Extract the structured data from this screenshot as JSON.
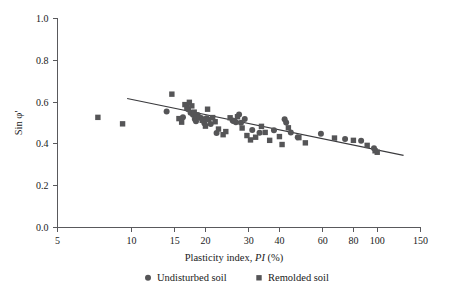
{
  "chart_data": {
    "type": "scatter",
    "title": "",
    "xlabel": "Plasticity index, PI (%)",
    "xlabel_parts": {
      "prefix": "Plasticity index, ",
      "italic": "PI",
      "suffix": " (%)"
    },
    "ylabel": "Sin φ'",
    "xscale": "log",
    "xlim": [
      5,
      150
    ],
    "ylim": [
      0.0,
      1.0
    ],
    "xticks": [
      5,
      10,
      15,
      20,
      30,
      40,
      60,
      80,
      100,
      150
    ],
    "xticklabels": [
      "5",
      "10",
      "15",
      "20",
      "30",
      "40",
      "60",
      "80",
      "100",
      "150"
    ],
    "yticks": [
      0.0,
      0.2,
      0.4,
      0.6,
      0.8,
      1.0
    ],
    "yticklabels": [
      "0.0",
      "0.2",
      "0.4",
      "0.6",
      "0.8",
      "1.0"
    ],
    "grid": false,
    "legend_position": "below",
    "marker_color": "#555557",
    "line_color": "#3a3a3d",
    "axis_color": "#59595c",
    "trend_line": {
      "label": "regression line",
      "x": [
        9.6,
        128.0
      ],
      "y": [
        0.617,
        0.345
      ]
    },
    "series": [
      {
        "name": "Undisturbed soil",
        "marker": "circle",
        "points": [
          [
            13.9,
            0.555
          ],
          [
            16.2,
            0.527
          ],
          [
            17.0,
            0.566
          ],
          [
            17.4,
            0.549
          ],
          [
            17.8,
            0.54
          ],
          [
            18.1,
            0.519
          ],
          [
            18.3,
            0.508
          ],
          [
            18.6,
            0.538
          ],
          [
            19.2,
            0.524
          ],
          [
            19.8,
            0.499
          ],
          [
            20.2,
            0.523
          ],
          [
            20.6,
            0.517
          ],
          [
            21.0,
            0.495
          ],
          [
            22.2,
            0.452
          ],
          [
            25.8,
            0.512
          ],
          [
            26.6,
            0.503
          ],
          [
            27.4,
            0.541
          ],
          [
            27.9,
            0.501
          ],
          [
            28.9,
            0.519
          ],
          [
            31.0,
            0.466
          ],
          [
            33.2,
            0.453
          ],
          [
            38.0,
            0.465
          ],
          [
            42.0,
            0.518
          ],
          [
            42.6,
            0.502
          ],
          [
            44.5,
            0.455
          ],
          [
            47.5,
            0.432
          ],
          [
            59.0,
            0.448
          ],
          [
            74.0,
            0.424
          ],
          [
            86.0,
            0.415
          ],
          [
            97.0,
            0.379
          ]
        ]
      },
      {
        "name": "Remolded soil",
        "marker": "square",
        "points": [
          [
            7.3,
            0.527
          ],
          [
            9.2,
            0.496
          ],
          [
            14.6,
            0.638
          ],
          [
            15.6,
            0.521
          ],
          [
            16.0,
            0.504
          ],
          [
            16.5,
            0.588
          ],
          [
            16.8,
            0.575
          ],
          [
            17.2,
            0.599
          ],
          [
            17.6,
            0.582
          ],
          [
            18.0,
            0.552
          ],
          [
            18.4,
            0.535
          ],
          [
            18.8,
            0.526
          ],
          [
            19.4,
            0.513
          ],
          [
            20.0,
            0.485
          ],
          [
            20.4,
            0.566
          ],
          [
            21.4,
            0.526
          ],
          [
            21.9,
            0.506
          ],
          [
            22.6,
            0.471
          ],
          [
            23.6,
            0.444
          ],
          [
            24.2,
            0.459
          ],
          [
            25.2,
            0.525
          ],
          [
            26.2,
            0.509
          ],
          [
            27.0,
            0.53
          ],
          [
            28.2,
            0.476
          ],
          [
            29.5,
            0.44
          ],
          [
            30.5,
            0.419
          ],
          [
            32.0,
            0.432
          ],
          [
            33.8,
            0.484
          ],
          [
            35.0,
            0.455
          ],
          [
            36.5,
            0.417
          ],
          [
            40.0,
            0.435
          ],
          [
            41.0,
            0.397
          ],
          [
            43.5,
            0.477
          ],
          [
            48.0,
            0.43
          ],
          [
            51.0,
            0.405
          ],
          [
            67.0,
            0.428
          ],
          [
            80.0,
            0.417
          ],
          [
            91.0,
            0.393
          ],
          [
            98.0,
            0.367
          ],
          [
            100.0,
            0.36
          ]
        ]
      }
    ]
  },
  "legend": {
    "items": [
      {
        "label": "Undisturbed soil",
        "marker": "circle"
      },
      {
        "label": "Remolded soil",
        "marker": "square"
      }
    ]
  }
}
